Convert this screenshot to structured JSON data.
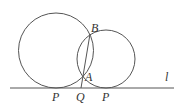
{
  "diagram": {
    "labels": {
      "point_B": "B",
      "point_A": "A",
      "point_Q": "Q",
      "tangent_left": "P",
      "tangent_right": "P",
      "line": "l"
    },
    "colors": {
      "stroke": "#555555",
      "text": "#333333",
      "background": "#ffffff"
    }
  }
}
